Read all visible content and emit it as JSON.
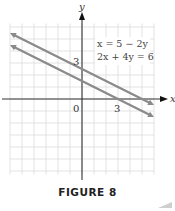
{
  "chart_data": {
    "type": "line",
    "title": "",
    "caption": "FIGURE 8",
    "xlabel": "x",
    "ylabel": "y",
    "xlim": [
      -6,
      6
    ],
    "ylim": [
      -6,
      6.3
    ],
    "grid": true,
    "grid_step": 1,
    "tick_labels": {
      "origin": "0",
      "x": [
        {
          "value": 3,
          "label": "3"
        }
      ],
      "y": [
        {
          "value": 3,
          "label": "3"
        }
      ]
    },
    "legend": {
      "position": "upper right",
      "entries": [
        "x = 5 − 2y",
        "2x + 4y = 6"
      ]
    },
    "series": [
      {
        "name": "x = 5 − 2y",
        "equation": "y = (5 − x)/2",
        "x": [
          -6,
          6
        ],
        "y": [
          5.5,
          -0.5
        ],
        "y_intercept": 2.5,
        "x_intercept": 5,
        "color": "#8a8a8a"
      },
      {
        "name": "2x + 4y = 6",
        "equation": "y = (3 − x)/2",
        "x": [
          -6,
          6
        ],
        "y": [
          4.5,
          -1.5
        ],
        "y_intercept": 1.5,
        "x_intercept": 3,
        "color": "#8a8a8a"
      }
    ]
  },
  "labels": {
    "x_axis": "x",
    "y_axis": "y",
    "origin": "0",
    "x_tick_3": "3",
    "y_tick_3": "3",
    "eq1": "x = 5 − 2y",
    "eq2": "2x + 4y = 6",
    "caption": "FIGURE 8"
  },
  "colors": {
    "grid": "#dcdcdc",
    "axis": "#333333",
    "line": "#8a8a8a",
    "text": "#333333"
  }
}
